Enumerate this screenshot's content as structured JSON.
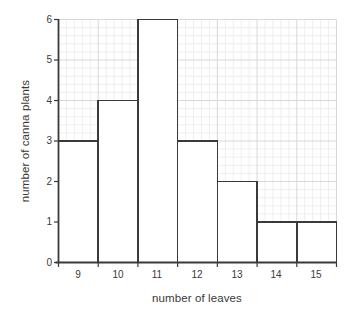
{
  "chart_data": {
    "type": "bar",
    "title": "",
    "subtitle": "",
    "xlabel": "number of leaves",
    "ylabel": "number of canna plants",
    "categories": [
      "9",
      "10",
      "11",
      "12",
      "13",
      "14",
      "15"
    ],
    "values": [
      3,
      4,
      6,
      3,
      2,
      1,
      1
    ],
    "series": [
      {
        "name": "number of canna plants",
        "values": [
          3,
          4,
          6,
          3,
          2,
          1,
          1
        ]
      }
    ],
    "xlim": [
      8.5,
      15.5
    ],
    "ylim": [
      0,
      6
    ],
    "ytick_labels": [
      "0",
      "1",
      "2",
      "3",
      "4",
      "5",
      "6"
    ],
    "ytick_values": [
      0,
      1,
      2,
      3,
      4,
      5,
      6
    ],
    "xtick_labels": [
      "9",
      "10",
      "11",
      "12",
      "13",
      "14",
      "15"
    ],
    "xtick_values": [
      9,
      10,
      11,
      12,
      13,
      14,
      15
    ],
    "bin_edges": [
      8.5,
      9.5,
      10.5,
      11.5,
      12.5,
      13.5,
      14.5,
      15.5
    ],
    "grid": true,
    "minor_grid": true,
    "minor_grid_divisions": 5,
    "legend": false,
    "legend_position": "none",
    "annotations": [],
    "colors": {
      "background": "#ffffff",
      "bar_fill": "#ffffff",
      "bar_stroke": "#3a3a3a",
      "axis": "#3a3a3a",
      "major_grid": "#d8d8d8",
      "minor_grid": "#efefef",
      "text": "#3a3a3a"
    }
  }
}
